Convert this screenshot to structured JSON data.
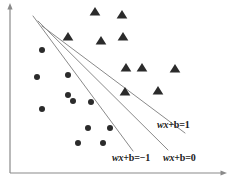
{
  "figure": {
    "background_color": "#ffffff",
    "width": 227,
    "height": 181
  },
  "axes": {
    "color": "#8a8a8a",
    "y_axis": {
      "name": "y-axis",
      "x": 10,
      "y_top": 8,
      "y_bottom": 173,
      "arrow": "up"
    },
    "x_axis": {
      "name": "x-axis",
      "y": 173,
      "x_left": 10,
      "x_right": 222,
      "arrow": "right"
    }
  },
  "labels": [
    {
      "id": "wx-b-eq-1",
      "math_italic": "wx",
      "math_upright": "+b=1",
      "full_text": "wx+b=1",
      "x": 157,
      "y": 120,
      "color": "#1a1a1a"
    },
    {
      "id": "wx-b-eq-minus-1",
      "math_italic": "wx",
      "math_upright": "+b=−1",
      "full_text": "wx+b=-1",
      "x": 112,
      "y": 153,
      "color": "#1a1a1a"
    },
    {
      "id": "wx-b-eq-0",
      "math_italic": "wx",
      "math_upright": "+b=0",
      "full_text": "wx+b=0",
      "x": 163,
      "y": 153,
      "color": "#1a1a1a"
    }
  ],
  "chart_data": {
    "type": "scatter",
    "xlabel": "",
    "ylabel": "",
    "grid": false,
    "legend_position": "none",
    "xlim": [
      0,
      227
    ],
    "ylim": [
      0,
      181
    ],
    "marker_color": "#2b2b2b",
    "line_color": "#8a8a8a",
    "series": [
      {
        "name": "class-negative",
        "marker": "circle",
        "marker_size": 6,
        "color": "#2b2b2b",
        "points": [
          [
            42,
            50
          ],
          [
            37,
            77
          ],
          [
            68,
            75
          ],
          [
            42,
            109
          ],
          [
            68,
            95
          ],
          [
            73,
            101
          ],
          [
            91,
            102
          ],
          [
            88,
            128
          ],
          [
            110,
            128
          ],
          [
            78,
            143
          ],
          [
            103,
            143
          ]
        ]
      },
      {
        "name": "class-positive",
        "marker": "triangle",
        "marker_size": 8,
        "color": "#2b2b2b",
        "points": [
          [
            95,
            12
          ],
          [
            122,
            15
          ],
          [
            68,
            37
          ],
          [
            101,
            41
          ],
          [
            123,
            37
          ],
          [
            126,
            68
          ],
          [
            142,
            68
          ],
          [
            175,
            69
          ],
          [
            125,
            92
          ],
          [
            158,
            91
          ]
        ]
      }
    ],
    "lines": [
      {
        "name": "margin-line-negative",
        "label": "wx+b=-1",
        "x1": 33,
        "y1": 16,
        "x2": 133,
        "y2": 151,
        "color": "#8a8a8a",
        "width": 1
      },
      {
        "name": "decision-boundary",
        "label": "wx+b=0",
        "x1": 38,
        "y1": 21,
        "x2": 168,
        "y2": 150,
        "color": "#8a8a8a",
        "width": 1
      },
      {
        "name": "margin-line-positive",
        "label": "wx+b=1",
        "x1": 42,
        "y1": 26,
        "x2": 185,
        "y2": 133,
        "color": "#8a8a8a",
        "width": 1
      }
    ]
  }
}
